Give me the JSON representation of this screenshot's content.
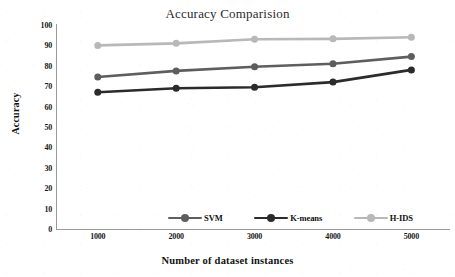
{
  "chart_data": {
    "type": "line",
    "title": "Accuracy Comparision",
    "xlabel": "Number of dataset instances",
    "ylabel": "Accuracy",
    "categories": [
      "1000",
      "2000",
      "3000",
      "4000",
      "5000"
    ],
    "x": [
      1000,
      2000,
      3000,
      4000,
      5000
    ],
    "ylim": [
      0,
      100
    ],
    "yticks": [
      "0",
      "10",
      "20",
      "30",
      "40",
      "50",
      "60",
      "70",
      "80",
      "90",
      "100"
    ],
    "ytick_values": [
      0,
      10,
      20,
      30,
      40,
      50,
      60,
      70,
      80,
      90,
      100
    ],
    "grid": false,
    "legend_position": "bottom-center",
    "series": [
      {
        "name": "SVM",
        "values": [
          74.5,
          77.5,
          79.5,
          81,
          84.5
        ],
        "color": "#5e5e5e",
        "marker": "circle"
      },
      {
        "name": "K-means",
        "values": [
          67,
          69,
          69.5,
          72,
          78
        ],
        "color": "#2b2b2b",
        "marker": "circle"
      },
      {
        "name": "H-IDS",
        "values": [
          90,
          91,
          93,
          93.2,
          94
        ],
        "color": "#b8b8b8",
        "marker": "circle"
      }
    ]
  },
  "legend": {
    "items": [
      {
        "label": "SVM",
        "color": "#5e5e5e"
      },
      {
        "label": "K-means",
        "color": "#2b2b2b"
      },
      {
        "label": "H-IDS",
        "color": "#b8b8b8"
      }
    ]
  },
  "axis_colors": {
    "axis_line": "#9a9a9a",
    "text": "#1a1a1a",
    "background": "#ffffff"
  }
}
